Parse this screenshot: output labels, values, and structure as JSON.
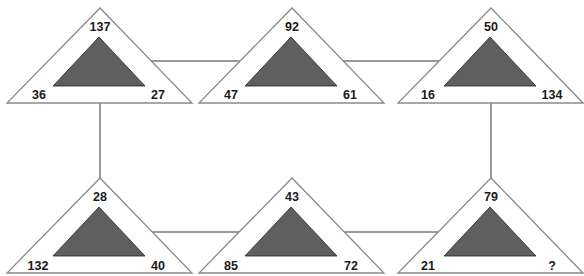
{
  "puzzle": {
    "colors": {
      "background": "#ffffff",
      "outer_stroke": "#8a8a8a",
      "inner_fill": "#5f5f5f",
      "connector": "#9a9a9a",
      "text": "#1a1a1a"
    },
    "triangles": [
      {
        "id": "t1",
        "top": "137",
        "left": "36",
        "right": "27"
      },
      {
        "id": "t2",
        "top": "92",
        "left": "47",
        "right": "61"
      },
      {
        "id": "t3",
        "top": "50",
        "left": "16",
        "right": "134"
      },
      {
        "id": "t4",
        "top": "28",
        "left": "132",
        "right": "40"
      },
      {
        "id": "t5",
        "top": "43",
        "left": "85",
        "right": "72"
      },
      {
        "id": "t6",
        "top": "79",
        "left": "21",
        "right": "?"
      }
    ]
  }
}
